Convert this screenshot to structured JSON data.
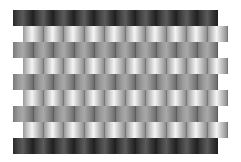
{
  "pattern": {
    "description": "Brick-wall shading pattern",
    "rows": [
      {
        "tone": "dark",
        "top": 10,
        "left": 13,
        "bricks": 10
      },
      {
        "tone": "light",
        "top": 26,
        "left": 23,
        "bricks": 10
      },
      {
        "tone": "mid",
        "top": 42,
        "left": 13,
        "bricks": 10
      },
      {
        "tone": "light",
        "top": 58,
        "left": 23,
        "bricks": 10
      },
      {
        "tone": "mid",
        "top": 74,
        "left": 13,
        "bricks": 10
      },
      {
        "tone": "light",
        "top": 90,
        "left": 23,
        "bricks": 10
      },
      {
        "tone": "mid",
        "top": 106,
        "left": 13,
        "bricks": 10
      },
      {
        "tone": "light",
        "top": 122,
        "left": 23,
        "bricks": 10
      },
      {
        "tone": "dark",
        "top": 138,
        "left": 13,
        "bricks": 10
      }
    ],
    "colors": {
      "dark": "#3a3a3a",
      "mid": "#9a9a9a",
      "light": "#e8e8e8",
      "background": "#ffffff"
    }
  }
}
